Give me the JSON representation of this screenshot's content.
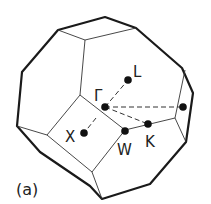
{
  "figure": {
    "caption": "(a)",
    "points": [
      {
        "id": "gamma",
        "label": "Γ"
      },
      {
        "id": "L",
        "label": "L"
      },
      {
        "id": "X",
        "label": "X"
      },
      {
        "id": "W",
        "label": "W"
      },
      {
        "id": "K",
        "label": "K"
      }
    ],
    "colors": {
      "edge": "#1a1a1a",
      "dot": "#111111",
      "background": "#ffffff"
    }
  }
}
